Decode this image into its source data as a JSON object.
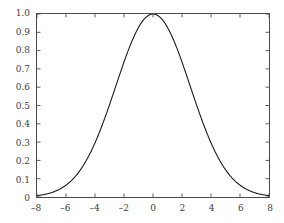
{
  "chart_data": {
    "type": "line",
    "title": "",
    "xlabel": "",
    "ylabel": "",
    "xlim": [
      -8,
      8
    ],
    "ylim": [
      0,
      1.0
    ],
    "grid": false,
    "legend": null,
    "x_ticks": [
      -8,
      -6,
      -4,
      -2,
      0,
      2,
      4,
      6,
      8
    ],
    "x_tick_labels": [
      "–8",
      "–6",
      "–4",
      "–2",
      "0",
      "2",
      "4",
      "6",
      "8"
    ],
    "y_ticks": [
      0,
      0.1,
      0.2,
      0.3,
      0.4,
      0.5,
      0.6,
      0.7,
      0.8,
      0.9,
      1.0
    ],
    "y_tick_labels": [
      "0",
      "0.1",
      "0.2",
      "0.3",
      "0.4",
      "0.5",
      "0.6",
      "0.7",
      "0.8",
      "0.9",
      "1.0"
    ],
    "series": [
      {
        "name": "gaussian",
        "color": "#1a1a1a",
        "line_width": 1.1,
        "x": [
          -8,
          -7.5,
          -7,
          -6.5,
          -6,
          -5.5,
          -5,
          -4.5,
          -4,
          -3.5,
          -3,
          -2.5,
          -2,
          -1.5,
          -1,
          -0.5,
          0,
          0.5,
          1,
          1.5,
          2,
          2.5,
          3,
          3.5,
          4,
          4.5,
          5,
          5.5,
          6,
          6.5,
          7,
          7.5,
          8
        ],
        "y": [
          0.0025,
          0.0054,
          0.0111,
          0.0216,
          0.0399,
          0.0698,
          0.1156,
          0.1813,
          0.2693,
          0.3787,
          0.5041,
          0.6354,
          0.7583,
          0.8566,
          0.9222,
          0.9545,
          1.0,
          0.9545,
          0.9222,
          0.8566,
          0.7583,
          0.6354,
          0.5041,
          0.3787,
          0.2693,
          0.1813,
          0.1156,
          0.0698,
          0.0399,
          0.0216,
          0.0111,
          0.0054,
          0.0025
        ]
      }
    ]
  },
  "axes": {
    "tick_color": "#4a4a4a",
    "border_color": "#4a4a4a",
    "background": "#ffffff"
  }
}
